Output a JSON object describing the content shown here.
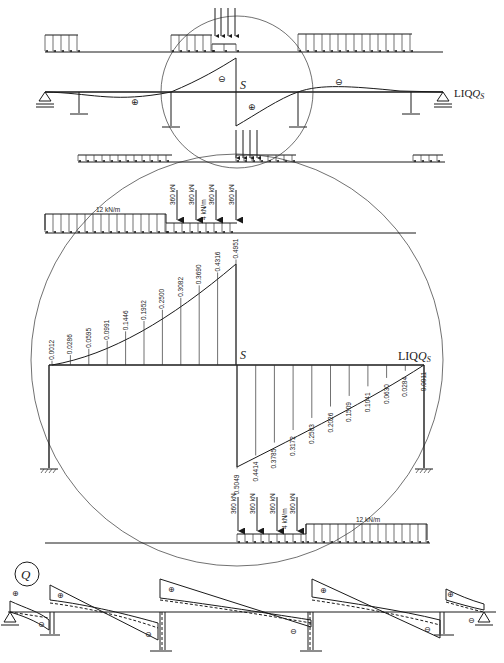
{
  "labels": {
    "section": "S",
    "influence_line": "LIQ",
    "influence_line_sub": "S",
    "shear_symbol": "Q",
    "plus": "⊕",
    "minus": "⊖"
  },
  "loads": {
    "axle_load": "360 kN",
    "lane_load_small": "4 kN/m",
    "lane_load_large": "12 kN/m"
  },
  "chart_data": {
    "type": "line",
    "xlabel": "",
    "ylabel": "",
    "series": [
      {
        "name": "left span (above axis)",
        "values": [
          0.0012,
          0.0286,
          0.0595,
          0.0991,
          0.1446,
          0.1952,
          0.25,
          0.3082,
          0.369,
          0.4316,
          0.4951
        ]
      },
      {
        "name": "right span (below axis)",
        "values": [
          0.5049,
          0.4414,
          0.3785,
          0.3172,
          0.2583,
          0.2026,
          0.1509,
          0.1041,
          0.063,
          0.0284,
          0.0011
        ]
      }
    ]
  }
}
